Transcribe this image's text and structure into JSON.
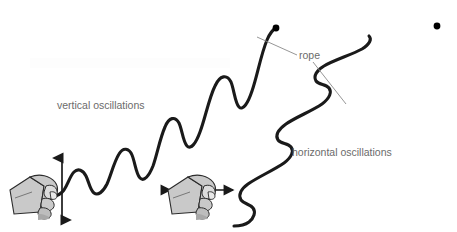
{
  "figure": {
    "width": 457,
    "height": 232,
    "background_color": "#ffffff"
  },
  "labels": {
    "vertical": "vertical oscillations",
    "horizontal": "horizontal oscillations",
    "rope": "rope"
  },
  "colors": {
    "rope_stroke": "#1a1a1a",
    "text": "#6b6b6b",
    "leader_line": "#8a8a8a",
    "hand_fill": "#c9c9c9",
    "hand_outline": "#2b2b2b",
    "hand_shadow": "#a8a8a8",
    "arrow": "#1a1a1a",
    "endpoint_dot": "#000000"
  },
  "elements": {
    "left_rope": {
      "name": "rope-left-vertical-wave",
      "description": "rope shaken vertically producing transverse wave rising to the upper right with growing amplitude",
      "start_point": [
        53,
        196
      ],
      "end_point": [
        276,
        28
      ],
      "crest_count": 5,
      "stroke_width": 3.1
    },
    "right_rope": {
      "name": "rope-right-horizontal-wave",
      "description": "rope shaken horizontally producing side-to-side zigzag wave rising to the upper right",
      "start_point": [
        212,
        190
      ],
      "end_point": [
        437,
        26
      ],
      "crest_count": 5,
      "stroke_width": 3.1
    },
    "left_hand": {
      "name": "hand-gripping-rope-vertical",
      "position": [
        10,
        172
      ],
      "size": [
        52,
        48
      ]
    },
    "right_hand": {
      "name": "hand-gripping-rope-horizontal",
      "position": [
        168,
        172
      ],
      "size": [
        52,
        48
      ]
    },
    "vertical_arrow": {
      "name": "vertical-double-arrow",
      "x": 62,
      "y_top": 154,
      "y_bottom": 224,
      "heads": 2,
      "orientation": "vertical"
    },
    "horizontal_arrow": {
      "name": "horizontal-double-arrow",
      "y": 190,
      "x_left": 166,
      "x_right": 237,
      "heads": 2,
      "orientation": "horizontal"
    },
    "rope_leader_lines": [
      {
        "from": [
          297,
          55
        ],
        "to": [
          258,
          38
        ]
      },
      {
        "from": [
          311,
          61
        ],
        "to": [
          345,
          103
        ]
      }
    ],
    "endpoint_dots": [
      {
        "cx": 276,
        "cy": 28,
        "r": 3.4
      },
      {
        "cx": 437,
        "cy": 26,
        "r": 3.4
      }
    ]
  }
}
